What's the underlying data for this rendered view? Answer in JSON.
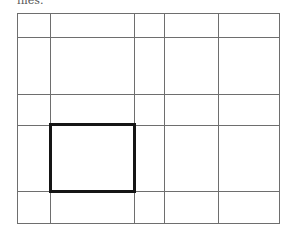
{
  "caption": "files.",
  "grid": {
    "left": 17,
    "top": 13,
    "right": 279,
    "bottom": 223,
    "columns_x": [
      17,
      50,
      134,
      164,
      218,
      279
    ],
    "rows_y": [
      13,
      37,
      94,
      125,
      191,
      223
    ],
    "line_color": "#6e6e6e"
  },
  "highlight": {
    "x": 49,
    "y": 123,
    "width": 87,
    "height": 70,
    "border_color": "#151515",
    "border_width": 3,
    "cell": {
      "column": 1,
      "row": 3
    }
  }
}
